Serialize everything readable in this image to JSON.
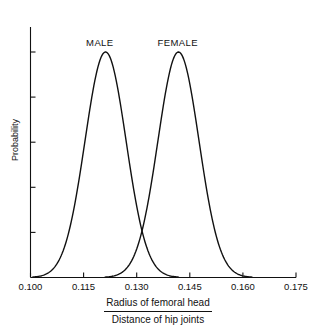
{
  "chart_data": {
    "type": "line",
    "title": "",
    "subtitle": "",
    "xlabel_numerator": "Radius of femoral head",
    "xlabel_denominator": "Distance of hip joints",
    "ylabel": "Probability",
    "xlim": [
      0.1,
      0.175
    ],
    "ylim": [
      0,
      1.0
    ],
    "xticks": [
      0.1,
      0.115,
      0.13,
      0.145,
      0.16,
      0.175
    ],
    "xtick_labels": [
      "0.100",
      "0.115",
      "0.130",
      "0.145",
      "0.160",
      "0.175"
    ],
    "ytick_values": [
      0.0,
      0.2,
      0.4,
      0.6,
      0.8,
      1.0
    ],
    "ytick_labels": [
      "",
      "",
      "",
      "",
      "",
      ""
    ],
    "grid": false,
    "legend_position": "inline-above-peaks",
    "line_color": "#111111",
    "axis_color": "#111111",
    "background_color": "#ffffff",
    "crossing_point": {
      "x": 0.13,
      "y": 0.395
    },
    "series": [
      {
        "name": "MALE",
        "label": "MALE",
        "distribution": "normal",
        "mean": 0.1212,
        "stdev": 0.0058,
        "peak_y": 1.0,
        "label_x": 0.1205,
        "x": [
          0.1,
          0.102,
          0.104,
          0.106,
          0.108,
          0.11,
          0.112,
          0.114,
          0.116,
          0.118,
          0.12,
          0.1212,
          0.122,
          0.124,
          0.126,
          0.128,
          0.13,
          0.132,
          0.134,
          0.136,
          0.138,
          0.14,
          0.142
        ],
        "values": [
          0.001,
          0.003,
          0.01,
          0.029,
          0.073,
          0.161,
          0.311,
          0.526,
          0.779,
          0.952,
          0.996,
          1.0,
          0.998,
          0.962,
          0.793,
          0.54,
          0.322,
          0.166,
          0.075,
          0.029,
          0.01,
          0.003,
          0.001
        ]
      },
      {
        "name": "FEMALE",
        "label": "FEMALE",
        "distribution": "normal",
        "mean": 0.1418,
        "stdev": 0.0058,
        "peak_y": 1.0,
        "label_x": 0.1418,
        "x": [
          0.12,
          0.122,
          0.124,
          0.126,
          0.128,
          0.13,
          0.132,
          0.134,
          0.136,
          0.138,
          0.14,
          0.1418,
          0.143,
          0.145,
          0.147,
          0.149,
          0.151,
          0.153,
          0.155,
          0.157,
          0.159,
          0.161,
          0.163
        ],
        "values": [
          0.001,
          0.003,
          0.01,
          0.029,
          0.073,
          0.161,
          0.311,
          0.526,
          0.779,
          0.952,
          0.996,
          1.0,
          0.998,
          0.962,
          0.793,
          0.54,
          0.322,
          0.166,
          0.075,
          0.029,
          0.01,
          0.003,
          0.001
        ]
      }
    ]
  },
  "axis_labels": {
    "x_numerator": "Radius of femoral head",
    "x_denominator": "Distance of hip joints",
    "y_title": "Probability"
  },
  "ticks": {
    "x": [
      "0.100",
      "0.115",
      "0.130",
      "0.145",
      "0.160",
      "0.175"
    ]
  },
  "series_labels": {
    "male": "MALE",
    "female": "FEMALE"
  }
}
